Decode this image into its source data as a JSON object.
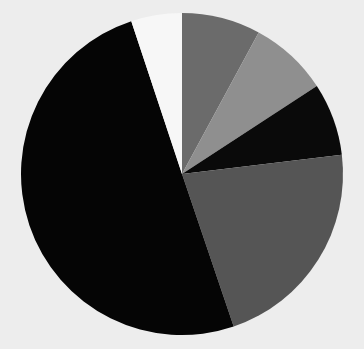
{
  "background": "#ededed",
  "chart_data": {
    "type": "pie",
    "title": "",
    "legend": "none",
    "start_angle_deg": 0,
    "direction": "clockwise",
    "center": [
      182,
      174
    ],
    "radius": 161,
    "slices": [
      {
        "label": "Slice 1",
        "value": 7.9,
        "color": "#6b6b6b"
      },
      {
        "label": "Slice 2",
        "value": 7.9,
        "color": "#8f8f8f"
      },
      {
        "label": "Slice 3",
        "value": 7.3,
        "color": "#0a0a0a"
      },
      {
        "label": "Slice 4",
        "value": 21.7,
        "color": "#555555"
      },
      {
        "label": "Slice 5",
        "value": 50.1,
        "color": "#050505"
      },
      {
        "label": "Slice 6",
        "value": 5.1,
        "color": "#f7f7f7"
      }
    ]
  }
}
